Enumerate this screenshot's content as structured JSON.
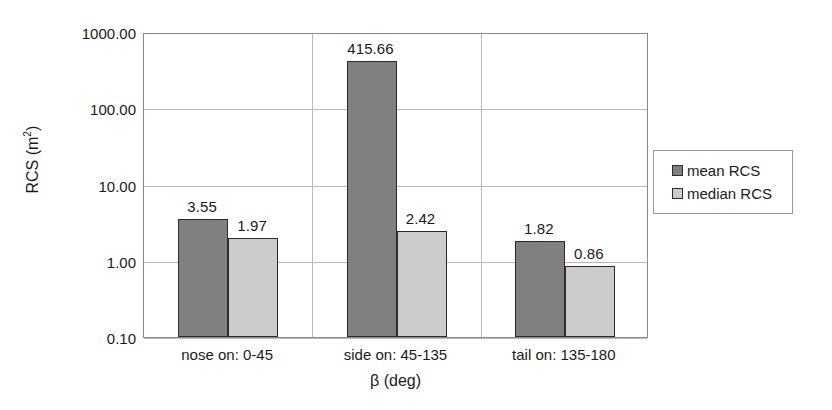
{
  "chart_data": {
    "type": "bar",
    "title": "",
    "xlabel": "β (deg)",
    "ylabel": "RCS (m²)",
    "ylabel_base": "RCS (m",
    "ylabel_sup": "2",
    "ylabel_tail": ")",
    "yscale": "log",
    "ylim": [
      0.1,
      1000.0
    ],
    "grid": true,
    "legend_position": "right",
    "categories": [
      "nose on:  0-45",
      "side on: 45-135",
      "tail on: 135-180"
    ],
    "ytick_labels": [
      "1000.00",
      "100.00",
      "10.00",
      "1.00",
      "0.10"
    ],
    "ytick_values": [
      1000.0,
      100.0,
      10.0,
      1.0,
      0.1
    ],
    "series": [
      {
        "name": "mean RCS",
        "color": "#808080",
        "values": [
          3.55,
          415.66,
          1.82
        ],
        "labels": [
          "3.55",
          "415.66",
          "1.82"
        ]
      },
      {
        "name": "median RCS",
        "color": "#cccccc",
        "values": [
          1.97,
          2.42,
          0.86
        ],
        "labels": [
          "1.97",
          "2.42",
          "0.86"
        ]
      }
    ]
  },
  "legend": {
    "items": [
      {
        "label": "mean RCS",
        "swatch": "mean"
      },
      {
        "label": "median RCS",
        "swatch": "median"
      }
    ]
  }
}
